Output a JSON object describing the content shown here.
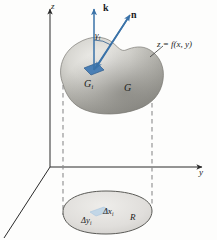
{
  "figure": {
    "axes": {
      "z_label": "z",
      "y_label": "y"
    },
    "vectors": {
      "k_label": "k",
      "n_label": "n",
      "angle_label": "γ",
      "angle_sub": "i"
    },
    "surface": {
      "equation_label": "z = f(x, y)",
      "patch_label": "G",
      "patch_sub": "i",
      "region_label": "G"
    },
    "base_region": {
      "region_label": "R",
      "dx_label": "Δx",
      "dx_sub": "i",
      "dy_label": "Δy",
      "dy_sub": "i"
    },
    "colors": {
      "vector_blue": "#3a72a8",
      "patch_blue": "#4a7fb5",
      "surface_grey": "#b9b9b5",
      "region_fill": "#dedcd8",
      "axis_black": "#2a2a2a",
      "dashed_grey": "#8c8c8c"
    }
  }
}
